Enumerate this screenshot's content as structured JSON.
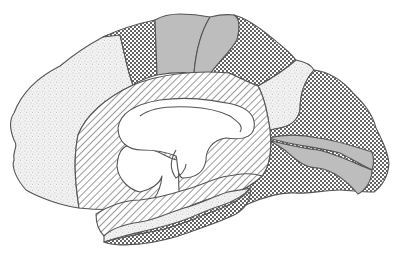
{
  "diagram": {
    "title": "",
    "background_color": "#ffffff",
    "outline_color": "#555555",
    "patterns": {
      "stipple": {
        "description": "fine irregular stipple",
        "fg": "#8a8a8a",
        "bg": "#f2f2f2"
      },
      "dots": {
        "description": "coarse regular dot grid",
        "fg": "#222222",
        "bg": "#ffffff"
      },
      "hatch": {
        "description": "diagonal line hatching",
        "fg": "#555555",
        "bg": "#ffffff"
      },
      "gray": {
        "description": "solid gray fill",
        "fg": "#bdbdbd"
      },
      "white": {
        "description": "unfilled",
        "fg": "#ffffff"
      }
    },
    "regions": [
      {
        "id": "frontal-medial",
        "pattern": "stipple"
      },
      {
        "id": "premotor-medial",
        "pattern": "dots"
      },
      {
        "id": "paracentral-anterior",
        "pattern": "gray"
      },
      {
        "id": "paracentral-posterior",
        "pattern": "gray"
      },
      {
        "id": "parietal-medial",
        "pattern": "dots"
      },
      {
        "id": "parieto-occipital",
        "pattern": "stipple"
      },
      {
        "id": "occipital-medial",
        "pattern": "dots"
      },
      {
        "id": "calcarine-upper",
        "pattern": "gray"
      },
      {
        "id": "calcarine-lower",
        "pattern": "gray"
      },
      {
        "id": "cingulate-limbic",
        "pattern": "hatch"
      },
      {
        "id": "parahippocampal",
        "pattern": "hatch"
      },
      {
        "id": "temporal-inferior-strip",
        "pattern": "stipple"
      },
      {
        "id": "temporal-medial-base",
        "pattern": "dots"
      },
      {
        "id": "corpus-callosum",
        "pattern": "white"
      }
    ],
    "labels": []
  }
}
